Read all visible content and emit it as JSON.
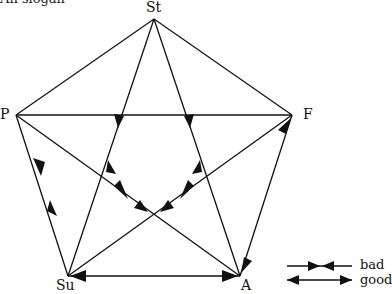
{
  "caption": "An slogan",
  "nodes": {
    "St": {
      "label": "St",
      "x": 154,
      "y": 19
    },
    "P": {
      "label": "P",
      "x": 16,
      "y": 115
    },
    "F": {
      "label": "F",
      "x": 292,
      "y": 115
    },
    "Su": {
      "label": "Su",
      "x": 68,
      "y": 276
    },
    "A": {
      "label": "A",
      "x": 240,
      "y": 276
    }
  },
  "legend": {
    "bad": "bad",
    "good": "good"
  },
  "edges": [
    {
      "from": "St",
      "to": "P",
      "type": "line"
    },
    {
      "from": "St",
      "to": "F",
      "type": "line"
    },
    {
      "from": "P",
      "to": "F",
      "type": "line"
    },
    {
      "from": "P",
      "to": "Su",
      "type": "bad"
    },
    {
      "from": "Su",
      "to": "A",
      "type": "good"
    },
    {
      "from": "F",
      "to": "A",
      "type": "good"
    },
    {
      "from": "St",
      "to": "Su",
      "type": "bad"
    },
    {
      "from": "St",
      "to": "A",
      "type": "bad"
    },
    {
      "from": "P",
      "to": "A",
      "type": "bad"
    },
    {
      "from": "F",
      "to": "Su",
      "type": "bad"
    }
  ],
  "colors": {
    "line": "#111111",
    "background": "#ffffff"
  }
}
